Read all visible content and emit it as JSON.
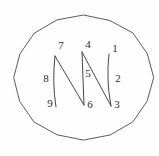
{
  "figure": {
    "colors": {
      "background": "#fefefe",
      "stroke": "#474747",
      "label": "#2b2b2b"
    },
    "circle": {
      "cx": 83.5,
      "cy": 77.5,
      "rx": 69.5,
      "ry": 62.5,
      "sides": 16
    },
    "path_segments": [
      {
        "name": "segment-9-7",
        "from": [
          56,
          107
        ],
        "to": [
          55,
          56
        ],
        "ctrl": [
          52,
          82
        ]
      },
      {
        "name": "segment-7-6",
        "from": [
          55,
          56
        ],
        "to": [
          84,
          105
        ]
      },
      {
        "name": "segment-6-4",
        "from": [
          84,
          105
        ],
        "to": [
          82,
          52
        ]
      },
      {
        "name": "segment-4-3",
        "from": [
          82,
          52
        ],
        "to": [
          111,
          106
        ]
      },
      {
        "name": "segment-3-1",
        "from": [
          111,
          106
        ],
        "to": [
          109,
          54
        ],
        "ctrl": [
          106,
          80
        ]
      }
    ],
    "labels": [
      {
        "text": "1",
        "x": 115,
        "y": 49
      },
      {
        "text": "2",
        "x": 118,
        "y": 79
      },
      {
        "text": "3",
        "x": 117,
        "y": 105
      },
      {
        "text": "4",
        "x": 88,
        "y": 45
      },
      {
        "text": "5",
        "x": 88,
        "y": 74
      },
      {
        "text": "6",
        "x": 90,
        "y": 105
      },
      {
        "text": "7",
        "x": 61,
        "y": 46
      },
      {
        "text": "8",
        "x": 46,
        "y": 79
      },
      {
        "text": "9",
        "x": 50,
        "y": 104
      }
    ]
  }
}
